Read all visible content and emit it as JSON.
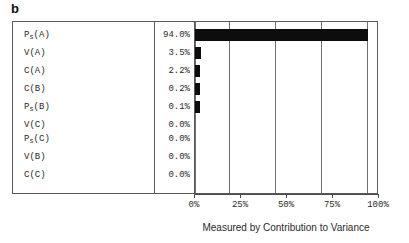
{
  "panel": {
    "label": "b"
  },
  "chart_data": {
    "type": "bar",
    "orientation": "horizontal",
    "title": "",
    "xlabel": "Measured by Contribution to Variance",
    "ylabel": "",
    "categories": [
      "Ps(A)",
      "V(A)",
      "C(A)",
      "C(B)",
      "Ps(B)",
      "V(C)",
      "Ps(C)",
      "V(B)",
      "C(C)"
    ],
    "category_parts": [
      {
        "base": "P",
        "sub": "s",
        "arg": "(A)"
      },
      {
        "base": "V",
        "sub": "",
        "arg": "(A)"
      },
      {
        "base": "C",
        "sub": "",
        "arg": "(A)"
      },
      {
        "base": "C",
        "sub": "",
        "arg": "(B)"
      },
      {
        "base": "P",
        "sub": "s",
        "arg": "(B)"
      },
      {
        "base": "V",
        "sub": "",
        "arg": "(C)"
      },
      {
        "base": "P",
        "sub": "s",
        "arg": "(C)"
      },
      {
        "base": "V",
        "sub": "",
        "arg": "(B)"
      },
      {
        "base": "C",
        "sub": "",
        "arg": "(C)"
      }
    ],
    "values": [
      94.0,
      3.5,
      2.2,
      0.2,
      0.1,
      0.0,
      0.0,
      0.0,
      0.0
    ],
    "value_labels": [
      "94.0%",
      "3.5%",
      "2.2%",
      "0.2%",
      "0.1%",
      "0.0%",
      "0.0%",
      "0.0%",
      "0.0%"
    ],
    "xlim": [
      0,
      100
    ],
    "xticks": [
      0,
      25,
      50,
      75,
      100
    ],
    "xtick_labels": [
      "0%",
      "25%",
      "50%",
      "75%",
      "100%"
    ],
    "grid": true,
    "legend": "none",
    "bar_color": "#0d0d0d",
    "frame_color": "#5a5a5a"
  }
}
